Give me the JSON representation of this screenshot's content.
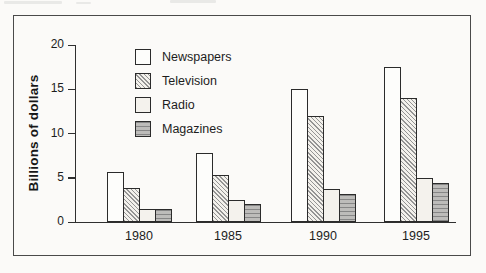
{
  "chart_data": {
    "type": "bar",
    "title": "",
    "xlabel": "",
    "ylabel": "Billions of dollars",
    "categories": [
      "1980",
      "1985",
      "1990",
      "1995"
    ],
    "series": [
      {
        "name": "Newspapers",
        "values": [
          5.7,
          7.8,
          15.0,
          17.5
        ],
        "fill": "#fdfdfb",
        "pattern": "none",
        "pattern_color": ""
      },
      {
        "name": "Television",
        "values": [
          3.8,
          5.3,
          12.0,
          14.0
        ],
        "fill": "#f3f1ec",
        "pattern": "hatch",
        "pattern_color": "#949494"
      },
      {
        "name": "Radio",
        "values": [
          1.5,
          2.5,
          3.7,
          5.0
        ],
        "fill": "#f4f2ed",
        "pattern": "none",
        "pattern_color": ""
      },
      {
        "name": "Magazines",
        "values": [
          1.5,
          2.0,
          3.2,
          4.4
        ],
        "fill": "#bdbcba",
        "pattern": "stripes",
        "pattern_color": "#868686"
      }
    ],
    "ylim": [
      0,
      20
    ],
    "yticks": [
      0,
      5,
      10,
      15,
      20
    ],
    "grid": false,
    "legend_position": "upper-left-inside"
  },
  "colors": {
    "background": "#fbfaf8",
    "frame_border": "#4a4a4a",
    "axis": "#2f2f2f",
    "bar_outline": "#2b2b2b",
    "text": "#1d1d1d"
  }
}
